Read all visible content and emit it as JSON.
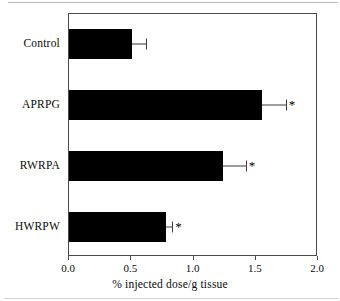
{
  "chart_data": {
    "type": "bar",
    "orientation": "horizontal",
    "title": "",
    "xlabel": "% injected dose/g tissue",
    "ylabel": "",
    "categories": [
      "Control",
      "APRPG",
      "RWRPA",
      "HWRPW"
    ],
    "values": [
      0.51,
      1.55,
      1.24,
      0.78
    ],
    "errors": [
      0.11,
      0.19,
      0.18,
      0.05
    ],
    "annotations": [
      "",
      "*",
      "*",
      "*"
    ],
    "xlim": [
      0.0,
      2.0
    ],
    "xticks": [
      "0.0",
      "0.5",
      "1.0",
      "1.5",
      "2.0"
    ],
    "xtick_values": [
      0.0,
      0.5,
      1.0,
      1.5,
      2.0
    ],
    "grid": false,
    "legend": "none",
    "bar_color": "#000000",
    "axis_color": "#4a4a4a",
    "significance_marker": "*"
  }
}
